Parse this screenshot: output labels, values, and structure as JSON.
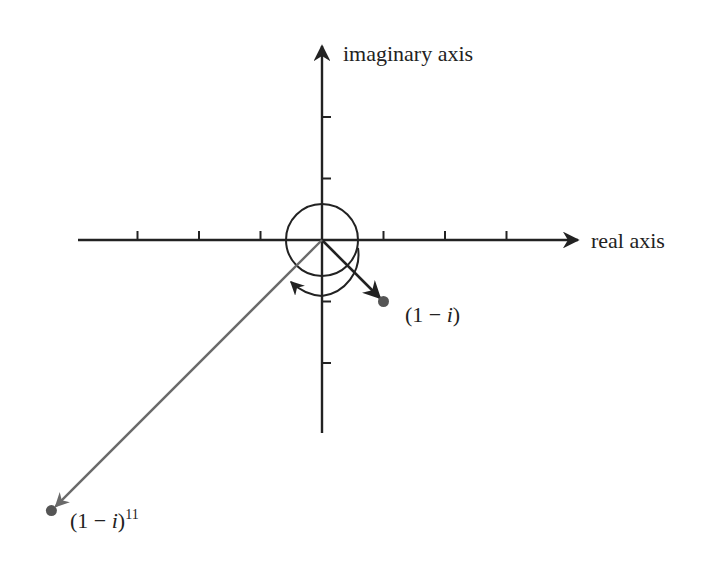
{
  "diagram": {
    "type": "complex-plane",
    "axes": {
      "real_label": "real axis",
      "imaginary_label": "imaginary axis",
      "real_ticks": [
        -3,
        -2,
        -1,
        1,
        2,
        3
      ],
      "imaginary_ticks": [
        -2,
        -1,
        1,
        2
      ]
    },
    "points": [
      {
        "id": "z",
        "label_main": "(1 − ",
        "label_i": "i",
        "label_close": ")",
        "label_exp": "",
        "re": 1,
        "im": -1
      },
      {
        "id": "z11",
        "label_main": "(1 − ",
        "label_i": "i",
        "label_close": ")",
        "label_exp": "11",
        "re": -4.4,
        "im": -4.4
      }
    ],
    "colors": {
      "ink": "#222222",
      "vector_long": "#6a6a6a",
      "point": "#555555"
    }
  }
}
